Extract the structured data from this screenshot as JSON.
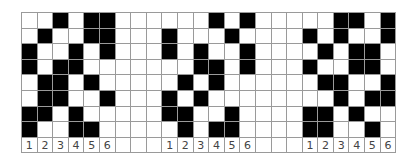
{
  "grid": {
    "columns": 24,
    "rows": 8,
    "filled_color": "#000000",
    "empty_color": "#ffffff",
    "line_color": "#9a9a9a",
    "cells": [
      [
        0,
        0,
        1,
        0,
        1,
        1,
        0,
        0,
        0,
        0,
        0,
        0,
        1,
        0,
        1,
        0,
        0,
        0,
        0,
        0,
        1,
        1,
        0,
        1
      ],
      [
        0,
        1,
        0,
        0,
        1,
        1,
        0,
        0,
        0,
        1,
        0,
        0,
        0,
        1,
        0,
        0,
        0,
        0,
        1,
        0,
        1,
        0,
        0,
        1
      ],
      [
        1,
        0,
        0,
        1,
        0,
        1,
        0,
        0,
        0,
        1,
        0,
        1,
        0,
        0,
        1,
        0,
        0,
        0,
        0,
        1,
        0,
        1,
        1,
        0
      ],
      [
        1,
        0,
        1,
        1,
        0,
        0,
        0,
        0,
        0,
        0,
        0,
        1,
        1,
        0,
        1,
        0,
        0,
        0,
        1,
        0,
        0,
        1,
        1,
        0
      ],
      [
        0,
        1,
        1,
        0,
        1,
        0,
        0,
        0,
        0,
        0,
        1,
        0,
        1,
        0,
        0,
        0,
        0,
        0,
        0,
        1,
        1,
        0,
        0,
        1
      ],
      [
        0,
        1,
        1,
        0,
        0,
        1,
        0,
        0,
        0,
        1,
        0,
        1,
        0,
        0,
        0,
        0,
        0,
        0,
        0,
        0,
        1,
        0,
        1,
        1
      ],
      [
        1,
        1,
        0,
        1,
        0,
        0,
        0,
        0,
        0,
        1,
        1,
        0,
        0,
        1,
        0,
        0,
        0,
        0,
        1,
        1,
        0,
        1,
        0,
        0
      ],
      [
        1,
        0,
        0,
        1,
        1,
        0,
        0,
        0,
        0,
        0,
        1,
        0,
        1,
        1,
        0,
        0,
        0,
        0,
        1,
        1,
        0,
        0,
        1,
        0
      ]
    ],
    "labels": [
      "1",
      "2",
      "3",
      "4",
      "5",
      "6",
      "",
      "",
      "",
      "1",
      "2",
      "3",
      "4",
      "5",
      "6",
      "",
      "",
      "",
      "1",
      "2",
      "3",
      "4",
      "5",
      "6"
    ]
  }
}
